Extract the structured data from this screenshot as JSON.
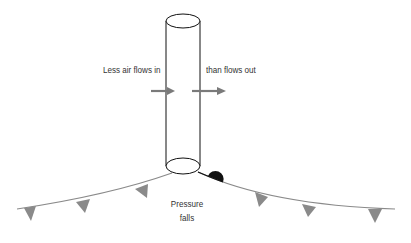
{
  "diagram": {
    "labels": {
      "inflow": "Less air flows in",
      "outflow": "than flows out",
      "pressure_line1": "Pressure",
      "pressure_line2": "falls"
    },
    "colors": {
      "arrow": "#7a7a7a",
      "front": "#8a8a8a",
      "outline": "#111111",
      "warm_front_semicircle": "#111111"
    }
  }
}
